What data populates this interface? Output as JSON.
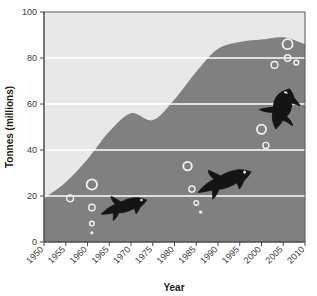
{
  "chart_data": {
    "type": "area",
    "title": "",
    "xlabel": "Year",
    "ylabel": "Tonnes (millions)",
    "xlim": [
      1950,
      2010
    ],
    "ylim": [
      0,
      100
    ],
    "xticks": [
      1950,
      1955,
      1960,
      1965,
      1970,
      1975,
      1980,
      1985,
      1990,
      1995,
      2000,
      2005,
      2010
    ],
    "yticks": [
      0,
      20,
      40,
      60,
      80,
      100
    ],
    "grid": "horizontal-white-gridlines",
    "legend": "none",
    "plot_bgcolor": "#e8e8e8",
    "area_color": "#808080",
    "gridline_color": "#ffffff",
    "series": [
      {
        "name": "Capture fisheries and aquaculture production",
        "x": [
          1950,
          1955,
          1960,
          1965,
          1970,
          1975,
          1980,
          1985,
          1990,
          1995,
          2000,
          2005,
          2010
        ],
        "values": [
          19,
          26,
          36,
          48,
          56,
          53,
          62,
          74,
          84,
          87,
          88,
          89,
          86
        ]
      }
    ],
    "decorations": {
      "fish_silhouettes": [
        {
          "name": "fish-small",
          "x_year": 1968,
          "y_value": 16,
          "width": 52,
          "height": 34,
          "rotation": -18
        },
        {
          "name": "fish-medium",
          "x_year": 1991,
          "y_value": 27,
          "width": 62,
          "height": 40,
          "rotation": -22
        },
        {
          "name": "fish-large",
          "x_year": 2004,
          "y_value": 58,
          "width": 46,
          "height": 76,
          "rotation": -72
        }
      ],
      "bubbles": [
        {
          "cx_year": 1956,
          "cy_value": 19,
          "r": 3.4
        },
        {
          "cx_year": 1961,
          "cy_value": 25,
          "r": 5.2
        },
        {
          "cx_year": 1961,
          "cy_value": 15,
          "r": 3.2
        },
        {
          "cx_year": 1961,
          "cy_value": 8,
          "r": 2.3
        },
        {
          "cx_year": 1961,
          "cy_value": 4,
          "r": 1.6
        },
        {
          "cx_year": 1983,
          "cy_value": 33,
          "r": 4.3
        },
        {
          "cx_year": 1984,
          "cy_value": 23,
          "r": 3.1
        },
        {
          "cx_year": 1985,
          "cy_value": 17,
          "r": 2.3
        },
        {
          "cx_year": 1986,
          "cy_value": 13,
          "r": 1.7
        },
        {
          "cx_year": 2000,
          "cy_value": 49,
          "r": 4.6
        },
        {
          "cx_year": 2001,
          "cy_value": 42,
          "r": 3.0
        },
        {
          "cx_year": 2003,
          "cy_value": 77,
          "r": 3.4
        },
        {
          "cx_year": 2006,
          "cy_value": 86,
          "r": 5.0
        },
        {
          "cx_year": 2006,
          "cy_value": 80,
          "r": 3.2
        },
        {
          "cx_year": 2008,
          "cy_value": 78,
          "r": 2.4
        }
      ]
    }
  },
  "axes": {
    "y_title": "Tonnes (millions)",
    "x_title": "Year",
    "y_tick_labels": [
      "0",
      "20",
      "40",
      "60",
      "80",
      "100"
    ],
    "x_tick_labels": [
      "1950",
      "1955",
      "1960",
      "1965",
      "1970",
      "1975",
      "1980",
      "1985",
      "1990",
      "1995",
      "2000",
      "2005",
      "2010"
    ]
  }
}
